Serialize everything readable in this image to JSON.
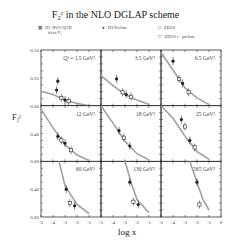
{
  "title": "F₂ᶜ  in the NLO DGLAP scheme",
  "legend": [
    {
      "symbol": "hatched-band",
      "label": "H1 NLO QCD",
      "sublabel": "fit to F₂"
    },
    {
      "symbol": "filled-circle",
      "label": "H1 Prelim."
    },
    {
      "symbol": "open-square",
      "label": "ZEUS"
    },
    {
      "symbol": "open-triangle-down",
      "label": "ZEUS e⁺ prelim."
    }
  ],
  "axes": {
    "ylabel": "F₂ᶜ",
    "xlabel": "log x",
    "xticks": [
      "-5",
      "-4",
      "-3",
      "-2",
      "-1",
      "0"
    ],
    "row_yticks": [
      [
        "0.50",
        "0.25",
        "0.00"
      ],
      [
        "0.40",
        "0.00"
      ],
      [
        "0.40",
        "0.00"
      ]
    ]
  },
  "chart_data": {
    "type": "scatter",
    "xlabel": "log x",
    "ylabel": "F2c",
    "layout": "3x3 grid of panels sharing x axis",
    "xlim": [
      -5,
      0
    ],
    "grid": false,
    "legend_position": "top",
    "panels": [
      {
        "Q2": "1.5 GeV²",
        "ylim": [
          0,
          0.5
        ],
        "points": [
          {
            "x": -3.7,
            "y": 0.14
          },
          {
            "x": -3.3,
            "y": 0.07
          },
          {
            "x": -3.0,
            "y": 0.05
          },
          {
            "x": -2.7,
            "y": 0.04
          },
          {
            "x": -3.6,
            "y": 0.22
          }
        ],
        "curve": [
          [
            -5,
            0.13
          ],
          [
            -4,
            0.1
          ],
          [
            -3,
            0.05
          ],
          [
            -2,
            0.02
          ],
          [
            -1,
            0.0
          ]
        ]
      },
      {
        "Q2": "3.5 GeV²",
        "ylim": [
          0,
          0.5
        ],
        "points": [
          {
            "x": -3.7,
            "y": 0.24
          },
          {
            "x": -3.2,
            "y": 0.12
          },
          {
            "x": -2.9,
            "y": 0.1
          },
          {
            "x": -2.5,
            "y": 0.08
          }
        ],
        "curve": [
          [
            -5,
            0.27
          ],
          [
            -4,
            0.18
          ],
          [
            -3,
            0.1
          ],
          [
            -2,
            0.05
          ],
          [
            -1,
            0.01
          ]
        ]
      },
      {
        "Q2": "6.5 GeV²",
        "ylim": [
          0,
          0.5
        ],
        "points": [
          {
            "x": -4.0,
            "y": 0.4
          },
          {
            "x": -3.5,
            "y": 0.24
          },
          {
            "x": -3.2,
            "y": 0.2
          },
          {
            "x": -2.7,
            "y": 0.12
          }
        ],
        "curve": [
          [
            -5,
            0.48
          ],
          [
            -4,
            0.32
          ],
          [
            -3,
            0.16
          ],
          [
            -2,
            0.07
          ],
          [
            -1,
            0.01
          ]
        ]
      },
      {
        "Q2": "12 GeV²",
        "ylim": [
          0,
          0.8
        ],
        "points": [
          {
            "x": -3.6,
            "y": 0.36
          },
          {
            "x": -3.3,
            "y": 0.3
          },
          {
            "x": -3.0,
            "y": 0.26
          },
          {
            "x": -2.5,
            "y": 0.16
          }
        ],
        "curve": [
          [
            -5,
            0.75
          ],
          [
            -4,
            0.48
          ],
          [
            -3,
            0.24
          ],
          [
            -2,
            0.09
          ],
          [
            -1,
            0.01
          ]
        ]
      },
      {
        "Q2": "18 GeV²",
        "ylim": [
          0,
          0.8
        ],
        "points": [
          {
            "x": -3.5,
            "y": 0.44
          },
          {
            "x": -3.1,
            "y": 0.34
          },
          {
            "x": -2.6,
            "y": 0.22
          }
        ],
        "curve": [
          [
            -5,
            0.85
          ],
          [
            -4,
            0.55
          ],
          [
            -3,
            0.29
          ],
          [
            -2,
            0.11
          ],
          [
            -1,
            0.02
          ]
        ]
      },
      {
        "Q2": "25 GeV²",
        "ylim": [
          0,
          0.8
        ],
        "points": [
          {
            "x": -3.3,
            "y": 0.6
          },
          {
            "x": -3.0,
            "y": 0.5
          },
          {
            "x": -2.6,
            "y": 0.3
          },
          {
            "x": -2.2,
            "y": 0.2
          }
        ],
        "curve": [
          [
            -5,
            0.9
          ],
          [
            -4,
            0.62
          ],
          [
            -3,
            0.36
          ],
          [
            -2,
            0.14
          ],
          [
            -1,
            0.03
          ]
        ]
      },
      {
        "Q2": "60 GeV²",
        "ylim": [
          0,
          0.8
        ],
        "points": [
          {
            "x": -2.9,
            "y": 0.4
          },
          {
            "x": -2.6,
            "y": 0.2
          },
          {
            "x": -2.2,
            "y": 0.16
          }
        ],
        "curve": [
          [
            -3.5,
            0.8
          ],
          [
            -3,
            0.45
          ],
          [
            -2,
            0.18
          ],
          [
            -1,
            0.05
          ]
        ]
      },
      {
        "Q2": "130 GeV²",
        "ylim": [
          0,
          0.8
        ],
        "points": [
          {
            "x": -2.6,
            "y": 0.5
          },
          {
            "x": -2.3,
            "y": 0.22
          },
          {
            "x": -1.9,
            "y": 0.18
          }
        ],
        "curve": [
          [
            -3.0,
            0.8
          ],
          [
            -2.5,
            0.5
          ],
          [
            -2,
            0.25
          ],
          [
            -1,
            0.06
          ]
        ]
      },
      {
        "Q2": "565 GeV²",
        "ylim": [
          0,
          0.8
        ],
        "points": [
          {
            "x": -2.0,
            "y": 0.5
          },
          {
            "x": -1.8,
            "y": 0.18
          }
        ],
        "curve": [
          [
            -2.6,
            0.8
          ],
          [
            -2,
            0.5
          ],
          [
            -1.5,
            0.25
          ],
          [
            -1,
            0.1
          ]
        ]
      }
    ]
  }
}
